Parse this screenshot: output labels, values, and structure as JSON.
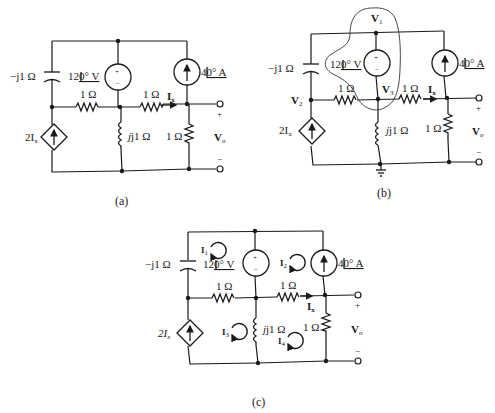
{
  "figure": {
    "panels": [
      {
        "id": "a",
        "caption": "(a)",
        "labels": {
          "capacitor": "−j1 Ω",
          "voltage_source": "12",
          "voltage_source_unit": "0° V",
          "current_source": "4",
          "current_source_unit": "0° A",
          "resistor_left": "1 Ω",
          "resistor_mid": "1 Ω",
          "current_label": "I",
          "current_sub": "x",
          "inductor": "j1 Ω",
          "resistor_right": "1 Ω",
          "dep_source": "2I",
          "dep_source_sub": "x",
          "vout": "V",
          "vout_sub": "o",
          "plus": "+",
          "minus": "−"
        }
      },
      {
        "id": "b",
        "caption": "(b)",
        "labels": {
          "node_v1": "V",
          "node_v1_sub": "1",
          "node_v2": "V",
          "node_v2_sub": "2",
          "node_v3": "V",
          "node_v3_sub": "3",
          "capacitor": "−j1 Ω",
          "voltage_source": "12",
          "voltage_source_unit": "0° V",
          "current_source": "4",
          "current_source_unit": "0° A",
          "resistor_left": "1 Ω",
          "resistor_mid": "1 Ω",
          "current_label": "I",
          "current_sub": "x",
          "inductor": "j1 Ω",
          "resistor_right": "1 Ω",
          "dep_source": "2I",
          "dep_source_sub": "x",
          "vout": "V",
          "vout_sub": "o",
          "plus": "+",
          "minus": "−",
          "supernode": "supernode enclosing V1 and V3"
        }
      },
      {
        "id": "c",
        "caption": "(c)",
        "labels": {
          "mesh_1": "I",
          "mesh_1_sub": "1",
          "mesh_2": "I",
          "mesh_2_sub": "2",
          "mesh_3": "I",
          "mesh_3_sub": "3",
          "mesh_4": "I",
          "mesh_4_sub": "4",
          "capacitor": "−j1 Ω",
          "voltage_source": "12",
          "voltage_source_unit": "0° V",
          "current_source": "4",
          "current_source_unit": "0° A",
          "resistor_left": "1 Ω",
          "resistor_mid": "1 Ω",
          "current_label": "I",
          "current_sub": "x",
          "inductor": "j1 Ω",
          "resistor_right": "1 Ω",
          "dep_source": "2I",
          "dep_source_sub": "x",
          "vout": "V",
          "vout_sub": "o",
          "plus": "+",
          "minus": "−"
        }
      }
    ]
  }
}
